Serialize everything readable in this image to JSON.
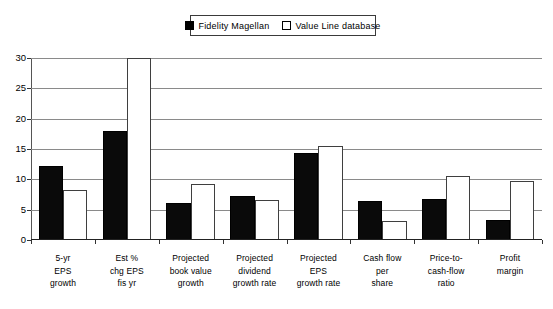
{
  "legend": {
    "position": "top-center",
    "entries": [
      {
        "label": "Fidelity Magellan",
        "swatch": "filled-square",
        "color": "#000000"
      },
      {
        "label": "Value Line database",
        "swatch": "open-square",
        "color": "#ffffff"
      }
    ]
  },
  "chart_data": {
    "type": "bar",
    "title": "",
    "subtitle": "",
    "xlabel": "",
    "ylabel": "",
    "ylim": [
      0,
      30
    ],
    "yticks": [
      0,
      5,
      10,
      15,
      20,
      25,
      30
    ],
    "ytick_labels": [
      "0",
      "5",
      "10",
      "15",
      "20",
      "25",
      "30"
    ],
    "grid": true,
    "grid_axis": "y",
    "legend_position": "top-center",
    "categories": [
      "5-yr EPS growth",
      "Est % chg EPS fis yr",
      "Projected book value growth",
      "Projected dividend growth rate",
      "Projected EPS growth rate",
      "Cash flow per share",
      "Price-to-cash-flow ratio",
      "Profit margin"
    ],
    "category_lines": [
      [
        "5-yr",
        "EPS",
        "growth"
      ],
      [
        "Est %",
        "chg EPS",
        "fis yr"
      ],
      [
        "Projected",
        "book value",
        "growth"
      ],
      [
        "Projected",
        "dividend",
        "growth rate"
      ],
      [
        "Projected",
        "EPS",
        "growth rate"
      ],
      [
        "Cash flow",
        "per",
        "share"
      ],
      [
        "Price-to-",
        "cash-flow",
        "ratio"
      ],
      [
        "Profit",
        "margin"
      ]
    ],
    "series": [
      {
        "name": "Fidelity Magellan",
        "color": "#000000",
        "values": [
          12.2,
          18.0,
          6.1,
          7.3,
          14.4,
          6.5,
          6.7,
          3.3
        ]
      },
      {
        "name": "Value Line database",
        "color": "#ffffff",
        "values": [
          8.2,
          30.0,
          9.3,
          6.6,
          15.5,
          3.2,
          10.5,
          9.7
        ],
        "notes": [
          "",
          "off-scale: bar extends above the 30 axis maximum and is clipped",
          "",
          "",
          "",
          "",
          "",
          ""
        ]
      }
    ]
  }
}
